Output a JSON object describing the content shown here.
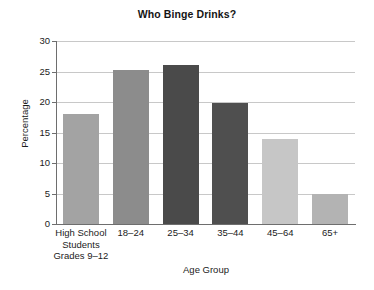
{
  "chart_data": {
    "type": "bar",
    "title": "Who Binge Drinks?",
    "xlabel": "Age Group",
    "ylabel": "Percentage",
    "categories": [
      "High School Students Grades 9–12",
      "18–24",
      "25–34",
      "35–44",
      "45–64",
      "65+"
    ],
    "category_lines": [
      [
        "High School",
        "Students",
        "Grades 9–12"
      ],
      [
        "18–24"
      ],
      [
        "25–34"
      ],
      [
        "35–44"
      ],
      [
        "45–64"
      ],
      [
        "65+"
      ]
    ],
    "values": [
      18,
      25.3,
      26,
      19.8,
      14,
      5
    ],
    "bar_colors": [
      "#a3a3a3",
      "#8c8c8c",
      "#4a4a4a",
      "#4f4f4f",
      "#c6c6c6",
      "#b3b3b3"
    ],
    "ylim": [
      0,
      30
    ],
    "ytick_values": [
      0,
      5,
      10,
      15,
      20,
      25,
      30
    ],
    "ytick_labels": [
      "0",
      "5",
      "10",
      "15",
      "20",
      "25",
      "30"
    ],
    "grid": true,
    "legend": "none",
    "series": [
      {
        "name": "Percentage who binge drink",
        "values": [
          18,
          25.3,
          26,
          19.8,
          14,
          5
        ]
      }
    ]
  },
  "style": {
    "background": "#ffffff",
    "axis_color": "#6e6e6e",
    "grid_color": "#c8c8c8",
    "text_color": "#1b1b1b"
  }
}
